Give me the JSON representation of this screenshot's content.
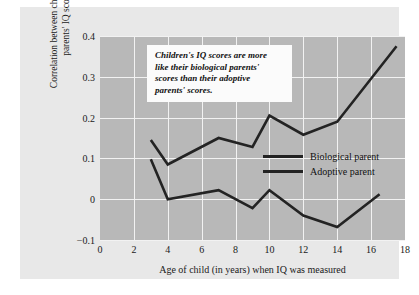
{
  "chart_data": {
    "type": "line",
    "title": "",
    "xlabel": "Age of child (in years) when IQ was measured",
    "ylabel": "Correlation between children's and parents' IQ scores",
    "xlim": [
      0,
      18
    ],
    "ylim": [
      -0.1,
      0.4
    ],
    "xticks": [
      0,
      2,
      4,
      6,
      8,
      10,
      12,
      14,
      16,
      18
    ],
    "xtick_labels": [
      "0",
      "2",
      "4",
      "6",
      "8",
      "10",
      "12",
      "14",
      "16",
      "18"
    ],
    "yticks": [
      -0.1,
      0,
      0.1,
      0.2,
      0.3,
      0.4
    ],
    "ytick_labels": [
      "−0.1",
      "0",
      "0.1",
      "0.2",
      "0.3",
      "0.4"
    ],
    "grid": true,
    "grid_color": "#f2f2f2",
    "plot_bgcolor": "#b8b8b8",
    "panel_bgcolor": "#e8e8e8",
    "line_color": "#232323",
    "legend_position": "center-right",
    "series": [
      {
        "name": "Biological parent",
        "x": [
          3,
          4,
          7,
          9,
          10,
          12,
          14,
          17.5
        ],
        "values": [
          0.145,
          0.085,
          0.15,
          0.128,
          0.205,
          0.158,
          0.19,
          0.375
        ]
      },
      {
        "name": "Adoptive parent",
        "x": [
          3,
          4,
          7,
          9,
          10,
          12,
          14,
          16.5
        ],
        "values": [
          0.098,
          0.0,
          0.022,
          -0.022,
          0.022,
          -0.04,
          -0.068,
          0.012
        ]
      }
    ],
    "annotation": {
      "text": "Children's IQ scores are more like their biological parents' scores than their adoptive parents' scores.",
      "lines": [
        "Children's IQ scores are more",
        "like their biological parents'",
        "scores than their adoptive",
        "parents' scores."
      ]
    }
  },
  "legend": {
    "items": [
      {
        "label": "Biological parent"
      },
      {
        "label": "Adoptive parent"
      }
    ]
  }
}
